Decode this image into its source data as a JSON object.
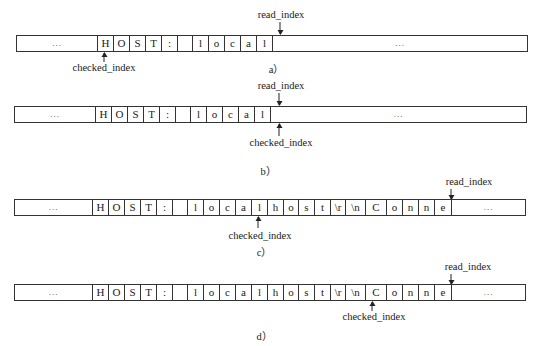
{
  "diagram": {
    "labels": {
      "read_index": "read_index",
      "checked_index": "checked_index"
    },
    "panels": [
      {
        "caption": "a）",
        "cells": [
          "...",
          "H",
          "O",
          "S",
          "T",
          ":",
          "",
          "l",
          "o",
          "c",
          "a",
          "l",
          "..."
        ],
        "read_index_after_cell": 11,
        "checked_index_at_cell": 1
      },
      {
        "caption": "b）",
        "cells": [
          "...",
          "H",
          "O",
          "S",
          "T",
          ":",
          "",
          "l",
          "o",
          "c",
          "a",
          "l",
          "..."
        ],
        "read_index_after_cell": 11,
        "checked_index_after_cell": 11
      },
      {
        "caption": "c）",
        "cells": [
          "...",
          "H",
          "O",
          "S",
          "T",
          ":",
          "",
          "l",
          "o",
          "c",
          "a",
          "l",
          "h",
          "o",
          "s",
          "t",
          "\\r",
          "\\n",
          "C",
          "o",
          "n",
          "n",
          "e",
          "..."
        ],
        "read_index_after_cell": 22,
        "checked_index_at_cell": 11
      },
      {
        "caption": "d）",
        "cells": [
          "...",
          "H",
          "O",
          "S",
          "T",
          ":",
          "",
          "l",
          "o",
          "c",
          "a",
          "l",
          "h",
          "o",
          "s",
          "t",
          "\\r",
          "\\n",
          "C",
          "o",
          "n",
          "n",
          "e",
          "..."
        ],
        "read_index_after_cell": 22,
        "checked_index_at_cell": 18
      }
    ]
  }
}
